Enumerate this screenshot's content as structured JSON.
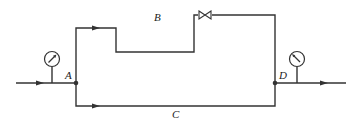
{
  "diagram": {
    "type": "pipe-network",
    "nodes": [
      {
        "id": "A",
        "label": "A"
      },
      {
        "id": "D",
        "label": "D"
      }
    ],
    "branches": [
      {
        "id": "B",
        "label": "B",
        "from": "A",
        "to": "D",
        "has_valve": true
      },
      {
        "id": "C",
        "label": "C",
        "from": "A",
        "to": "D",
        "has_valve": false
      }
    ],
    "instruments": [
      {
        "id": "gauge-inlet",
        "type": "pressure-gauge",
        "location": "upstream of A"
      },
      {
        "id": "gauge-outlet",
        "type": "pressure-gauge",
        "location": "downstream of D"
      }
    ],
    "flow_direction": "left-to-right",
    "line_color": "#333333"
  },
  "labels": {
    "A": "A",
    "B": "B",
    "C": "C",
    "D": "D"
  }
}
